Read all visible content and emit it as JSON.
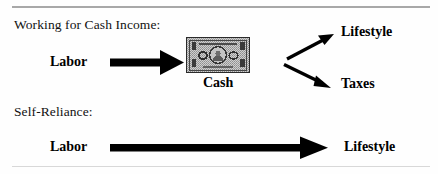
{
  "figure": {
    "width": 438,
    "height": 174,
    "background_color": "#fefefe",
    "rule_color": "#a8a8a8",
    "ink_color": "#000000"
  },
  "sections": [
    {
      "id": "working-for-cash-income",
      "caption": "Working for Cash Income:",
      "nodes": [
        {
          "id": "labor-1",
          "label": "Labor"
        },
        {
          "id": "cash",
          "label": "Cash"
        },
        {
          "id": "lifestyle-1",
          "label": "Lifestyle"
        },
        {
          "id": "taxes",
          "label": "Taxes"
        }
      ],
      "arrows": [
        {
          "id": "labor-to-cash",
          "from": "labor-1",
          "to": "cash",
          "direction": "right",
          "style": "thick-block"
        },
        {
          "id": "cash-to-lifestyle",
          "from": "cash",
          "to": "lifestyle-1",
          "direction": "up-right",
          "style": "thin-diagonal"
        },
        {
          "id": "cash-to-taxes",
          "from": "cash",
          "to": "taxes",
          "direction": "down-right",
          "style": "thin-diagonal"
        }
      ]
    },
    {
      "id": "self-reliance",
      "caption": "Self-Reliance:",
      "nodes": [
        {
          "id": "labor-2",
          "label": "Labor"
        },
        {
          "id": "lifestyle-2",
          "label": "Lifestyle"
        }
      ],
      "arrows": [
        {
          "id": "labor-to-lifestyle",
          "from": "labor-2",
          "to": "lifestyle-2",
          "direction": "right",
          "style": "thick-block-long"
        }
      ]
    }
  ],
  "graphics": {
    "cash_bill": {
      "name": "dollar-bill-illustration",
      "description": "halftone gray banknote with dark border, corner ornaments, two oval seals and a central portrait medallion",
      "fill_color": "#b9b9b9",
      "border_color": "#2a2a2a"
    }
  }
}
